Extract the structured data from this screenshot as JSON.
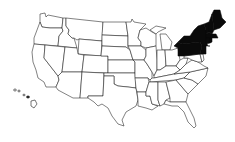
{
  "map": {
    "title": "United States",
    "highlighted_region": "Northeast",
    "highlight_color": "#0a0a0a",
    "base_fill": "#ffffff",
    "stroke_color": "#1a1a1a",
    "highlighted_states": [
      "New York",
      "Pennsylvania",
      "Vermont",
      "New Hampshire",
      "Maine",
      "Massachusetts",
      "Connecticut",
      "Rhode Island",
      "New Jersey"
    ],
    "insets": [
      "Hawaii"
    ]
  }
}
